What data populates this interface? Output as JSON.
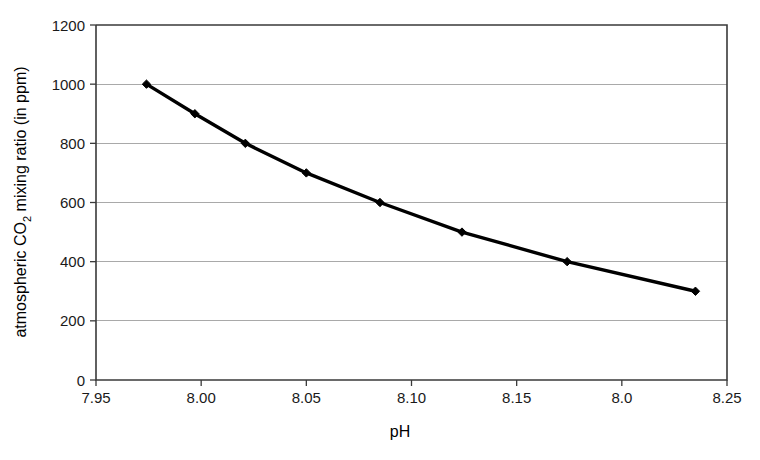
{
  "chart_data": {
    "type": "line",
    "title": "",
    "xlabel": "pH",
    "ylabel": "atmospheric CO2 mixing ratio (in ppm)",
    "ylabel_parts": {
      "before": "atmospheric CO",
      "subscript": "2",
      "after": " mixing ratio (in ppm)"
    },
    "xlim": [
      7.95,
      8.25
    ],
    "ylim": [
      0,
      1200
    ],
    "grid": "horizontal",
    "legend": "none",
    "marker": "diamond",
    "line_color": "#000000",
    "grid_color": "#a9a9a9",
    "frame_color": "#3a3a3a",
    "background": "#ffffff",
    "xticks": [
      7.95,
      8.0,
      8.05,
      8.1,
      8.15,
      8.2,
      8.25
    ],
    "xtick_labels": [
      "7.95",
      "8.00",
      "8.05",
      "8.10",
      "8.15",
      "8.0",
      "8.25"
    ],
    "yticks": [
      0,
      200,
      400,
      600,
      800,
      1000,
      1200
    ],
    "ytick_labels": [
      "0",
      "200",
      "400",
      "600",
      "800",
      "1000",
      "1200"
    ],
    "x": [
      7.974,
      7.997,
      8.021,
      8.05,
      8.085,
      8.124,
      8.174,
      8.235
    ],
    "values": [
      1000,
      900,
      800,
      700,
      600,
      500,
      400,
      300
    ],
    "points": [
      {
        "ph": 7.974,
        "co2": 1000
      },
      {
        "ph": 7.997,
        "co2": 900
      },
      {
        "ph": 8.021,
        "co2": 800
      },
      {
        "ph": 8.05,
        "co2": 700
      },
      {
        "ph": 8.085,
        "co2": 600
      },
      {
        "ph": 8.124,
        "co2": 500
      },
      {
        "ph": 8.174,
        "co2": 400
      },
      {
        "ph": 8.235,
        "co2": 300
      }
    ]
  }
}
